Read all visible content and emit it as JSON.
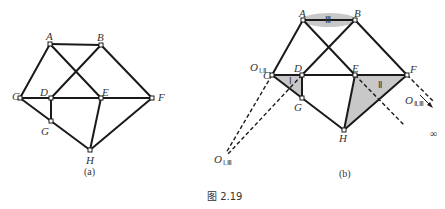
{
  "figure": {
    "caption": "图 2.19",
    "top_text": "",
    "colors": {
      "line": "#1a1a1a",
      "shade": "#c8c8c8",
      "background": "#ffffff"
    }
  },
  "diagram_a": {
    "caption": "(a)",
    "nodes": [
      {
        "id": "A",
        "label": "A"
      },
      {
        "id": "B",
        "label": "B"
      },
      {
        "id": "C",
        "label": "C"
      },
      {
        "id": "D",
        "label": "D"
      },
      {
        "id": "E",
        "label": "E"
      },
      {
        "id": "F",
        "label": "F"
      },
      {
        "id": "G",
        "label": "G"
      },
      {
        "id": "H",
        "label": "H"
      }
    ],
    "edges": [
      "A-B",
      "A-C",
      "A-E",
      "B-D",
      "B-F",
      "C-F",
      "C-G",
      "D-G",
      "G-H",
      "E-H",
      "F-H"
    ]
  },
  "diagram_b": {
    "caption": "(b)",
    "nodes": [
      {
        "id": "A",
        "label": "A"
      },
      {
        "id": "B",
        "label": "B"
      },
      {
        "id": "C",
        "label": "C"
      },
      {
        "id": "D",
        "label": "D"
      },
      {
        "id": "E",
        "label": "E"
      },
      {
        "id": "F",
        "label": "F"
      },
      {
        "id": "G",
        "label": "G"
      },
      {
        "id": "H",
        "label": "H"
      }
    ],
    "bodies": [
      {
        "id": "I",
        "label": "Ⅰ"
      },
      {
        "id": "II",
        "label": "Ⅱ"
      },
      {
        "id": "III",
        "label": "Ⅲ"
      }
    ],
    "poles": [
      {
        "id": "O_I_II",
        "main": "O",
        "sub": "Ⅰ,Ⅱ"
      },
      {
        "id": "O_I_III",
        "main": "O",
        "sub": "Ⅰ,Ⅲ"
      },
      {
        "id": "O_II_III",
        "main": "O",
        "sub": "Ⅱ,Ⅲ"
      }
    ],
    "infinity": "∞"
  }
}
